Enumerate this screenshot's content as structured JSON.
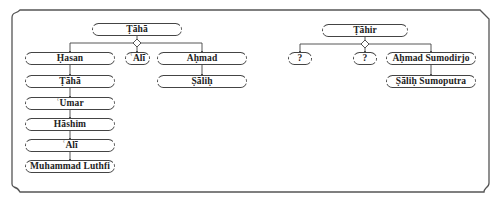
{
  "colors": {
    "line": "#444444",
    "frame": "#555555",
    "text": "#222222",
    "background": "#ffffff"
  },
  "left_tree": {
    "root": "Ṭāhā",
    "children": [
      "Ḥasan",
      "ʿAlī",
      "Aḥmad"
    ],
    "hasan_line": [
      "Ṭāhā",
      "ʿUmar",
      "Hāshim",
      "ʿAlī",
      "Muhammad Luthfi"
    ],
    "ahmad_line": [
      "Ṣāliḥ"
    ]
  },
  "right_tree": {
    "root": "Ṭāhir",
    "children": [
      "?",
      "?",
      "Aḥmad Sumodirjo"
    ],
    "ahmad_line": [
      "Ṣāliḥ Sumoputra"
    ]
  }
}
